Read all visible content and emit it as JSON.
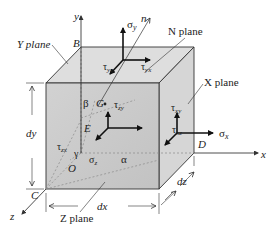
{
  "figure": {
    "type": "stress-element-3d",
    "colors": {
      "front_face": "#c9c9c9",
      "top_face": "#dcdcdc",
      "right_face": "#d4d4d4",
      "edge": "#333333",
      "arrow": "#111111",
      "dashed": "#888888"
    }
  },
  "axes": {
    "x": "x",
    "y": "y",
    "z": "z",
    "n": "n"
  },
  "points": {
    "B": "B",
    "C": "C",
    "D": "D",
    "O": "O",
    "G": "G",
    "E": "E"
  },
  "planes": {
    "y_plane": "Y plane",
    "x_plane": "X plane",
    "z_plane": "Z plane",
    "n_plane": "N plane"
  },
  "dimensions": {
    "dx": "dx",
    "dy": "dy",
    "dz": "dz"
  },
  "stresses": {
    "sigma_y": "σ",
    "sigma_y_sub": "y",
    "tau_yz": "τ",
    "tau_yz_sub": "yz",
    "tau_yx": "τ",
    "tau_yx_sub": "yx",
    "sigma_x": "σ",
    "sigma_x_sub": "x",
    "tau_xy": "τ",
    "tau_xy_sub": "xy",
    "tau_xz": "τ",
    "tau_xz_sub": "xz",
    "tau_zy": "τ",
    "tau_zy_sub": "zy",
    "tau_zx": "τ",
    "tau_zx_sub": "zx",
    "sigma_z": "σ",
    "sigma_z_sub": "z"
  },
  "angles": {
    "alpha": "α",
    "beta": "β",
    "gamma": "γ"
  }
}
